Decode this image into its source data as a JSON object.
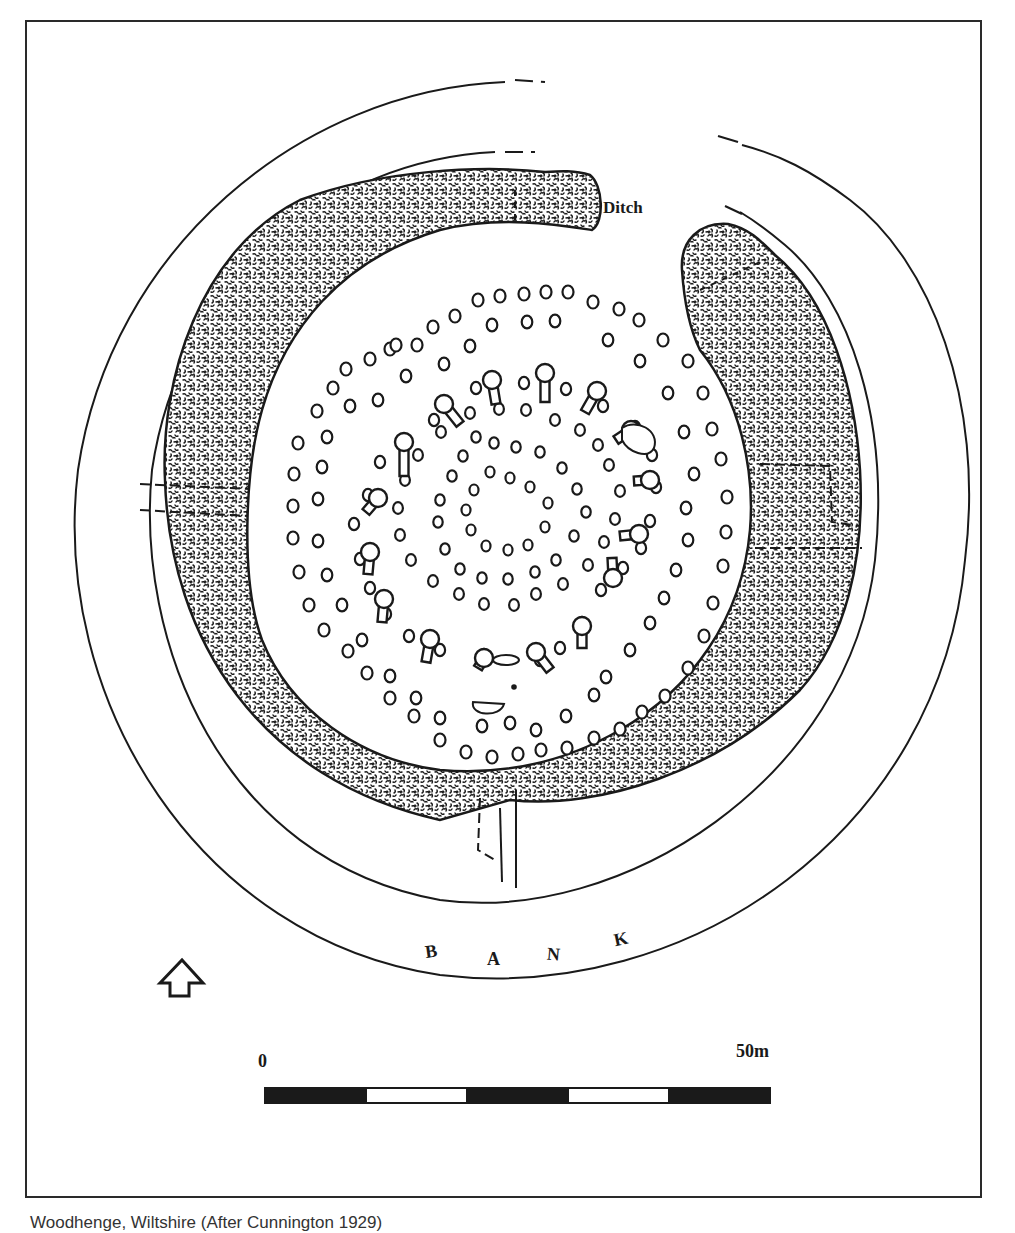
{
  "figure": {
    "labels": {
      "ditch": "Ditch",
      "bank_letters": [
        "B",
        "A",
        "N",
        "K"
      ]
    },
    "scale_bar": {
      "start_label": "0",
      "end_label": "50m",
      "segments": 5,
      "colors": [
        "#1a1a1a",
        "#ffffff",
        "#1a1a1a",
        "#ffffff",
        "#1a1a1a"
      ]
    },
    "north_arrow": {
      "icon": "north-arrow-icon"
    },
    "caption": "Woodhenge, Wiltshire (After Cunnington 1929)",
    "colors": {
      "ink": "#1a1a1a",
      "paper": "#ffffff",
      "ditch_fill": "#3a3a3a"
    }
  },
  "post_rings": {
    "ring_A": [
      [
        417,
        345
      ],
      [
        433,
        327
      ],
      [
        455,
        316
      ],
      [
        478,
        300
      ],
      [
        500,
        296
      ],
      [
        524,
        294
      ],
      [
        546,
        292
      ],
      [
        568,
        292
      ],
      [
        593,
        302
      ],
      [
        619,
        309
      ],
      [
        639,
        320
      ],
      [
        663,
        340
      ],
      [
        688,
        361
      ],
      [
        703,
        393
      ],
      [
        712,
        429
      ],
      [
        721,
        459
      ],
      [
        727,
        497
      ],
      [
        726,
        532
      ],
      [
        723,
        566
      ],
      [
        713,
        603
      ],
      [
        704,
        636
      ],
      [
        688,
        668
      ],
      [
        665,
        696
      ],
      [
        642,
        712
      ],
      [
        620,
        729
      ],
      [
        594,
        738
      ],
      [
        567,
        748
      ],
      [
        541,
        750
      ],
      [
        518,
        754
      ],
      [
        492,
        757
      ],
      [
        466,
        752
      ],
      [
        440,
        740
      ],
      [
        414,
        716
      ],
      [
        390,
        698
      ],
      [
        367,
        673
      ],
      [
        348,
        651
      ],
      [
        324,
        630
      ],
      [
        309,
        605
      ],
      [
        299,
        572
      ],
      [
        293,
        538
      ],
      [
        293,
        506
      ],
      [
        294,
        474
      ],
      [
        298,
        443
      ],
      [
        317,
        411
      ],
      [
        333,
        388
      ],
      [
        346,
        369
      ],
      [
        370,
        359
      ],
      [
        390,
        349
      ],
      [
        396,
        345
      ]
    ],
    "ring_B": [
      [
        444,
        364
      ],
      [
        470,
        346
      ],
      [
        492,
        325
      ],
      [
        527,
        322
      ],
      [
        555,
        321
      ],
      [
        608,
        340
      ],
      [
        640,
        361
      ],
      [
        668,
        393
      ],
      [
        684,
        432
      ],
      [
        694,
        474
      ],
      [
        686,
        508
      ],
      [
        688,
        540
      ],
      [
        676,
        570
      ],
      [
        664,
        598
      ],
      [
        650,
        623
      ],
      [
        630,
        650
      ],
      [
        606,
        677
      ],
      [
        594,
        695
      ],
      [
        566,
        716
      ],
      [
        536,
        730
      ],
      [
        510,
        723
      ],
      [
        482,
        726
      ],
      [
        440,
        718
      ],
      [
        416,
        698
      ],
      [
        390,
        676
      ],
      [
        362,
        640
      ],
      [
        342,
        605
      ],
      [
        327,
        575
      ],
      [
        318,
        541
      ],
      [
        318,
        499
      ],
      [
        322,
        467
      ],
      [
        327,
        437
      ],
      [
        350,
        406
      ],
      [
        378,
        400
      ],
      [
        406,
        376
      ]
    ],
    "ring_C": [
      [
        476,
        388
      ],
      [
        524,
        383
      ],
      [
        566,
        389
      ],
      [
        603,
        406
      ],
      [
        635,
        427
      ],
      [
        652,
        455
      ],
      [
        656,
        487
      ],
      [
        650,
        521
      ],
      [
        641,
        548
      ],
      [
        623,
        568
      ],
      [
        601,
        590
      ],
      [
        582,
        623
      ],
      [
        560,
        648
      ],
      [
        540,
        660
      ],
      [
        484,
        655
      ],
      [
        440,
        650
      ],
      [
        409,
        636
      ],
      [
        386,
        614
      ],
      [
        370,
        588
      ],
      [
        360,
        559
      ],
      [
        354,
        524
      ],
      [
        368,
        495
      ],
      [
        380,
        462
      ],
      [
        405,
        444
      ],
      [
        434,
        420
      ]
    ],
    "ring_D": [
      [
        470,
        413
      ],
      [
        499,
        409
      ],
      [
        526,
        410
      ],
      [
        555,
        420
      ],
      [
        580,
        430
      ],
      [
        598,
        445
      ],
      [
        609,
        465
      ],
      [
        620,
        491
      ],
      [
        615,
        519
      ],
      [
        604,
        542
      ],
      [
        588,
        565
      ],
      [
        563,
        584
      ],
      [
        536,
        594
      ],
      [
        514,
        605
      ],
      [
        484,
        604
      ],
      [
        459,
        594
      ],
      [
        433,
        581
      ],
      [
        411,
        560
      ],
      [
        400,
        535
      ],
      [
        398,
        508
      ],
      [
        405,
        480
      ],
      [
        418,
        455
      ],
      [
        441,
        432
      ]
    ],
    "ring_E": [
      [
        476,
        437
      ],
      [
        494,
        443
      ],
      [
        516,
        447
      ],
      [
        540,
        452
      ],
      [
        562,
        468
      ],
      [
        577,
        489
      ],
      [
        586,
        512
      ],
      [
        574,
        536
      ],
      [
        556,
        560
      ],
      [
        535,
        572
      ],
      [
        508,
        579
      ],
      [
        482,
        578
      ],
      [
        460,
        569
      ],
      [
        445,
        549
      ],
      [
        438,
        522
      ],
      [
        440,
        500
      ],
      [
        452,
        476
      ],
      [
        463,
        456
      ]
    ],
    "ring_F": [
      [
        490,
        472
      ],
      [
        510,
        478
      ],
      [
        530,
        487
      ],
      [
        548,
        503
      ],
      [
        545,
        527
      ],
      [
        528,
        545
      ],
      [
        508,
        550
      ],
      [
        486,
        546
      ],
      [
        471,
        530
      ],
      [
        466,
        510
      ],
      [
        474,
        490
      ]
    ]
  },
  "large_posts": [
    [
      444,
      404,
      460,
      424
    ],
    [
      492,
      380,
      496,
      404
    ],
    [
      545,
      373,
      545,
      402
    ],
    [
      597,
      391,
      585,
      412
    ],
    [
      404,
      442,
      404,
      476
    ],
    [
      378,
      498,
      366,
      512
    ],
    [
      370,
      552,
      368,
      574
    ],
    [
      384,
      599,
      382,
      622
    ],
    [
      430,
      639,
      426,
      662
    ],
    [
      484,
      658,
      478,
      668
    ],
    [
      536,
      652,
      550,
      670
    ],
    [
      582,
      626,
      582,
      648
    ],
    [
      613,
      578,
      612,
      558
    ],
    [
      639,
      534,
      620,
      536
    ],
    [
      650,
      480,
      634,
      481
    ],
    [
      631,
      430,
      616,
      440
    ]
  ]
}
